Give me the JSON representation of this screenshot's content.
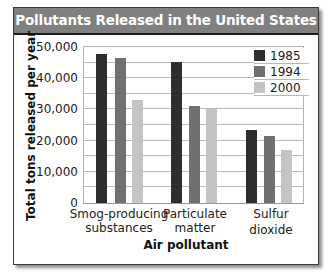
{
  "chart_data": {
    "type": "bar",
    "title": "Pollutants Released in the United States",
    "xlabel": "Air pollutant",
    "ylabel": "Total tons released per year",
    "categories": [
      "Smog-producing substances",
      "Particulate matter",
      "Sulfur dioxide"
    ],
    "category_lines": [
      [
        "Smog-producing",
        "substances"
      ],
      [
        "Particulate",
        "matter"
      ],
      [
        "Sulfur",
        "dioxide"
      ]
    ],
    "series": [
      {
        "name": "1985",
        "color": "#2e2e2e",
        "values": [
          47800,
          45300,
          23400
        ]
      },
      {
        "name": "1994",
        "color": "#707070",
        "values": [
          46500,
          31000,
          21500
        ]
      },
      {
        "name": "2000",
        "color": "#c4c4c4",
        "values": [
          33000,
          30000,
          17000
        ]
      }
    ],
    "ylim": [
      0,
      50000
    ],
    "yticks": [
      0,
      10000,
      20000,
      30000,
      40000,
      50000
    ],
    "ytick_labels": [
      "0",
      "10,000",
      "20,000",
      "30,000",
      "40,000",
      "50,000"
    ],
    "grid": true,
    "grid_step": 5000,
    "legend_position": "upper right"
  },
  "colors": {
    "title_bar": "#808080",
    "title_text": "#ffffff",
    "gridline": "#b8b8b8",
    "frame_border": "#3a3a3a"
  }
}
